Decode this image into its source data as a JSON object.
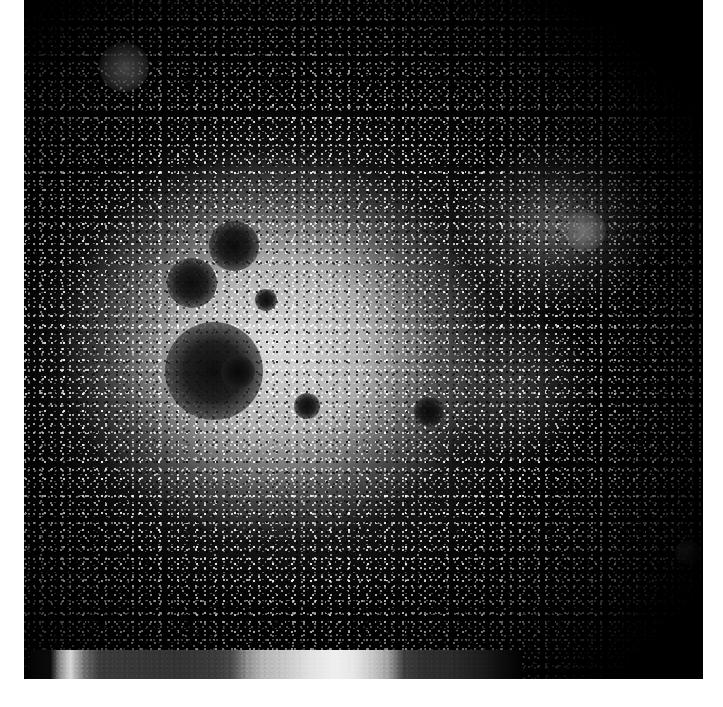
{
  "figure": {
    "kind": "density-map",
    "background_color": "#ffffff",
    "panel": {
      "name": "intensity-map-panel",
      "background_color": "#000000",
      "left": 24,
      "top": 0,
      "width": 679,
      "height": 679,
      "description": "Noisy grayscale point-density / intensity map with a bright diffuse core left of centre fading to black at the edges"
    }
  },
  "chart_data": {
    "type": "heatmap",
    "title": "",
    "subtitle": "",
    "xlabel": "",
    "ylabel": "",
    "grid": false,
    "legend_position": "bottom",
    "colormap": "grayscale",
    "axis_ticks_visible": false,
    "tick_labels": {
      "x": [],
      "y": []
    },
    "xlim": [
      0,
      679
    ],
    "ylim": [
      0,
      679
    ],
    "value_range_note": "no numeric tick labels are rendered on the colorbar",
    "colorbar": {
      "name": "grayscale-colorbar",
      "orientation": "horizontal",
      "left": 31,
      "top": 650,
      "width": 490,
      "height": 29,
      "ticks": [],
      "tick_labels": [],
      "stops": [
        {
          "pos": 0,
          "color": "#050505"
        },
        {
          "pos": 4,
          "color": "#0a0a0a"
        },
        {
          "pos": 6,
          "color": "#8f8f8f"
        },
        {
          "pos": 8,
          "color": "#d8d8d8"
        },
        {
          "pos": 11,
          "color": "#6a6a6a"
        },
        {
          "pos": 14,
          "color": "#3a3a3a"
        },
        {
          "pos": 30,
          "color": "#333333"
        },
        {
          "pos": 38,
          "color": "#3b3b3b"
        },
        {
          "pos": 41,
          "color": "#4a4a4a"
        },
        {
          "pos": 44,
          "color": "#8d8d8d"
        },
        {
          "pos": 47,
          "color": "#b4b4b4"
        },
        {
          "pos": 52,
          "color": "#c8c8c8"
        },
        {
          "pos": 57,
          "color": "#e2e2e2"
        },
        {
          "pos": 62,
          "color": "#efefef"
        },
        {
          "pos": 66,
          "color": "#e6e6e6"
        },
        {
          "pos": 70,
          "color": "#c4c4c4"
        },
        {
          "pos": 73,
          "color": "#9e9e9e"
        },
        {
          "pos": 76,
          "color": "#3e3e3e"
        },
        {
          "pos": 80,
          "color": "#2e2e2e"
        },
        {
          "pos": 86,
          "color": "#2a2a2a"
        },
        {
          "pos": 92,
          "color": "#1b1b1b"
        },
        {
          "pos": 96,
          "color": "#0d0d0d"
        },
        {
          "pos": 100,
          "color": "#020202"
        }
      ]
    },
    "features": [
      {
        "id": "core",
        "label": "bright diffuse core",
        "cx_pct": 37,
        "cy_pct": 51,
        "rx_pct": 36,
        "ry_pct": 33,
        "kind": "bright-extended"
      },
      {
        "id": "halo",
        "label": "faint outer halo",
        "cx_pct": 40,
        "cy_pct": 52,
        "rx_pct": 62,
        "ry_pct": 56,
        "kind": "faint-extended"
      },
      {
        "id": "clump-e",
        "label": "eastern clump",
        "cx_pct": 79,
        "cy_pct": 33,
        "rx_pct": 16,
        "ry_pct": 13,
        "kind": "bright-extended"
      },
      {
        "id": "clump-se",
        "label": "south-eastern clump",
        "cx_pct": 72,
        "cy_pct": 57,
        "rx_pct": 13,
        "ry_pct": 11,
        "kind": "bright-extended"
      }
    ],
    "masked_sources": [
      {
        "id": "m1",
        "label": "large masked source",
        "x": 214,
        "y": 371,
        "r": 26,
        "tone": "dark"
      },
      {
        "id": "m2",
        "label": "masked source",
        "x": 192,
        "y": 283,
        "r": 13,
        "tone": "dark"
      },
      {
        "id": "m3",
        "label": "masked source",
        "x": 234,
        "y": 246,
        "r": 13,
        "tone": "dark"
      },
      {
        "id": "m4",
        "label": "masked source",
        "x": 238,
        "y": 372,
        "r": 9,
        "tone": "dark"
      },
      {
        "id": "m5",
        "label": "small masked source",
        "x": 429,
        "y": 412,
        "r": 8,
        "tone": "dark"
      },
      {
        "id": "m6",
        "label": "small masked source",
        "x": 307,
        "y": 406,
        "r": 7,
        "tone": "dark"
      },
      {
        "id": "m7",
        "label": "faint masked source",
        "x": 266,
        "y": 300,
        "r": 6,
        "tone": "dark"
      },
      {
        "id": "m8",
        "label": "bright compact blob",
        "x": 124,
        "y": 67,
        "r": 13,
        "tone": "bright"
      },
      {
        "id": "m9",
        "label": "bright compact blob",
        "x": 585,
        "y": 231,
        "r": 11,
        "tone": "bright"
      },
      {
        "id": "m10",
        "label": "faint bright blob",
        "x": 688,
        "y": 553,
        "r": 7,
        "tone": "bright"
      }
    ]
  }
}
